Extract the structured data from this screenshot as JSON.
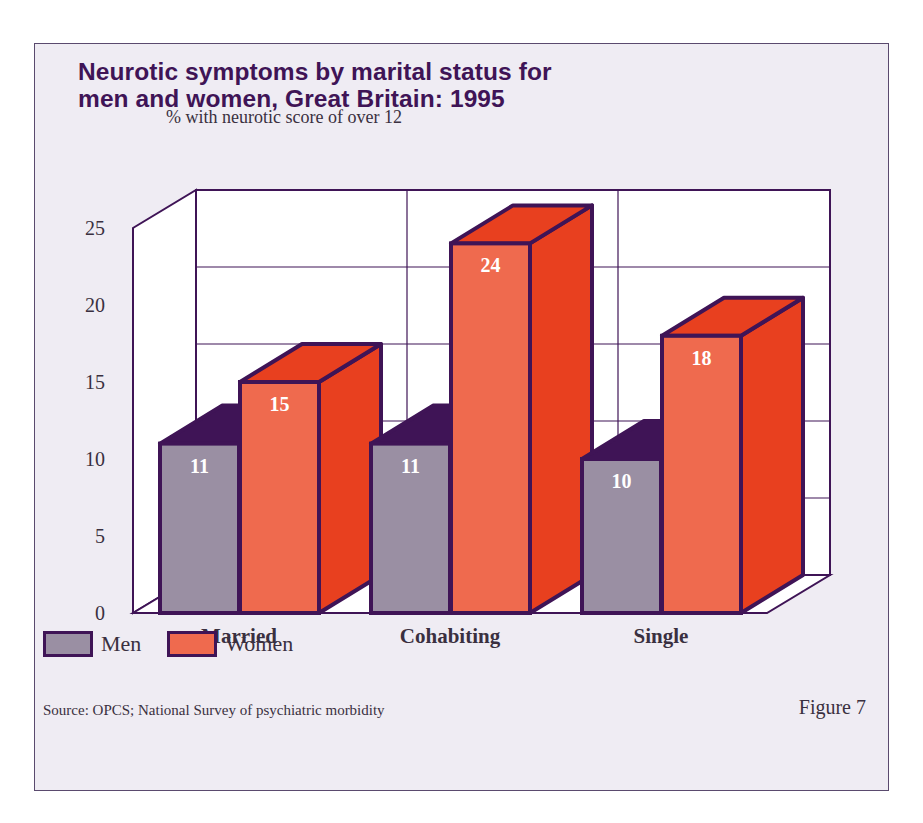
{
  "figure": {
    "title_lines": [
      "Neurotic symptoms by marital status for",
      "men and women, Great Britain: 1995"
    ],
    "y_axis_label": "% with neurotic score of over 12",
    "source": "Source: OPCS; National Survey of psychiatric morbidity",
    "figure_label": "Figure 7"
  },
  "legend": [
    {
      "name": "Men",
      "color": "#9a8fa3"
    },
    {
      "name": "Women",
      "color": "#ef6a4e"
    }
  ],
  "colors": {
    "outline": "#3f1456",
    "men_front": "#9a8fa3",
    "men_top": "#3f1456",
    "women_front": "#ef6a4e",
    "women_side": "#e8401f",
    "women_top": "#e8401f",
    "wall": "#ffffff",
    "background": "#efecf3",
    "text": "#3a3040"
  },
  "chart_data": {
    "type": "bar",
    "style": "3d-clustered",
    "title": "Neurotic symptoms by marital status for men and women, Great Britain: 1995",
    "xlabel": "",
    "ylabel": "% with neurotic score of over 12",
    "categories": [
      "Married",
      "Cohabiting",
      "Single"
    ],
    "series": [
      {
        "name": "Men",
        "values": [
          11,
          11,
          10
        ]
      },
      {
        "name": "Women",
        "values": [
          15,
          24,
          18
        ]
      }
    ],
    "yticks": [
      0,
      5,
      10,
      15,
      20,
      25
    ],
    "ylim": [
      0,
      25
    ],
    "grid": true,
    "data_labels": true,
    "legend_position": "bottom-left"
  }
}
